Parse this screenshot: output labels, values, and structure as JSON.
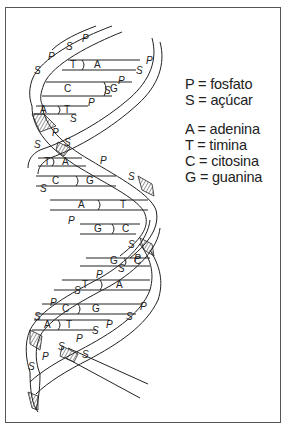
{
  "legend": {
    "backbone": [
      {
        "key": "P",
        "label": "P = fosfato"
      },
      {
        "key": "S",
        "label": "S = açúcar"
      }
    ],
    "bases": [
      {
        "key": "A",
        "label": "A = adenina"
      },
      {
        "key": "T",
        "label": "T = timina"
      },
      {
        "key": "C",
        "label": "C = citosina"
      },
      {
        "key": "G",
        "label": "G = guanina"
      }
    ]
  },
  "helix": {
    "base_pairs_top_to_bottom": [
      [
        "T",
        "A"
      ],
      [
        "C",
        "G"
      ],
      [
        "A",
        "T"
      ],
      [
        "T",
        "A"
      ],
      [
        "C",
        "G"
      ],
      [
        "A",
        "T"
      ],
      [
        "G",
        "C"
      ],
      [
        "G",
        "C"
      ],
      [
        "T",
        "A"
      ],
      [
        "C",
        "G"
      ],
      [
        "A",
        "T"
      ]
    ],
    "strand_labels": [
      "S",
      "P"
    ],
    "line_color": "#222222",
    "background": "#ffffff"
  }
}
